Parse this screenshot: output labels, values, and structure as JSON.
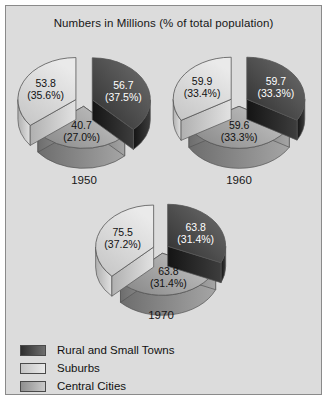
{
  "title": "Numbers in Millions (% of total population)",
  "legend": {
    "items": [
      {
        "label": "Rural and Small Towns",
        "key": "rural",
        "color": "#3a3a3a"
      },
      {
        "label": "Suburbs",
        "key": "suburbs",
        "color": "#d9d9d9"
      },
      {
        "label": "Central Cities",
        "key": "central",
        "color": "#a8a8a8"
      }
    ]
  },
  "colors": {
    "rural_dark": "#2e2e2e",
    "rural_light": "#6f6f6f",
    "suburbs_dark": "#c4c4c4",
    "suburbs_light": "#eaeaea",
    "central_dark": "#8f8f8f",
    "central_light": "#c9c9c9",
    "panel_bg": "#dcdcdc",
    "frame_border": "#8a8a8a",
    "outline": "#555555",
    "text": "#161616"
  },
  "pies": [
    {
      "year": "1950",
      "slices": [
        {
          "key": "rural",
          "value": "56.7",
          "percent": "(37.5%)",
          "pct": 37.5,
          "label_class": "on-dark"
        },
        {
          "key": "central",
          "value": "40.7",
          "percent": "(27.0%)",
          "pct": 27.0,
          "label_class": ""
        },
        {
          "key": "suburbs",
          "value": "53.8",
          "percent": "(35.6%)",
          "pct": 35.6,
          "label_class": ""
        }
      ]
    },
    {
      "year": "1960",
      "slices": [
        {
          "key": "rural",
          "value": "59.7",
          "percent": "(33.3%)",
          "pct": 33.3,
          "label_class": "on-dark"
        },
        {
          "key": "central",
          "value": "59.6",
          "percent": "(33.3%)",
          "pct": 33.3,
          "label_class": ""
        },
        {
          "key": "suburbs",
          "value": "59.9",
          "percent": "(33.4%)",
          "pct": 33.4,
          "label_class": ""
        }
      ]
    },
    {
      "year": "1970",
      "slices": [
        {
          "key": "rural",
          "value": "63.8",
          "percent": "(31.4%)",
          "pct": 31.4,
          "label_class": "on-dark"
        },
        {
          "key": "central",
          "value": "63.8",
          "percent": "(31.4%)",
          "pct": 31.4,
          "label_class": ""
        },
        {
          "key": "suburbs",
          "value": "75.5",
          "percent": "(37.2%)",
          "pct": 37.2,
          "label_class": ""
        }
      ]
    }
  ],
  "chart_data": {
    "type": "pie",
    "title": "Numbers in Millions (% of total population)",
    "legend_position": "bottom-left",
    "unit": "millions",
    "categories": [
      "Rural and Small Towns",
      "Suburbs",
      "Central Cities"
    ],
    "charts": [
      {
        "title": "1950",
        "labels": [
          "Rural and Small Towns",
          "Suburbs",
          "Central Cities"
        ],
        "values": [
          56.7,
          53.8,
          40.7
        ],
        "percents": [
          37.5,
          35.6,
          27.0
        ]
      },
      {
        "title": "1960",
        "labels": [
          "Rural and Small Towns",
          "Suburbs",
          "Central Cities"
        ],
        "values": [
          59.7,
          59.9,
          59.6
        ],
        "percents": [
          33.3,
          33.4,
          33.3
        ]
      },
      {
        "title": "1970",
        "labels": [
          "Rural and Small Towns",
          "Suburbs",
          "Central Cities"
        ],
        "values": [
          63.8,
          75.5,
          63.8
        ],
        "percents": [
          31.4,
          37.2,
          31.4
        ]
      }
    ]
  }
}
